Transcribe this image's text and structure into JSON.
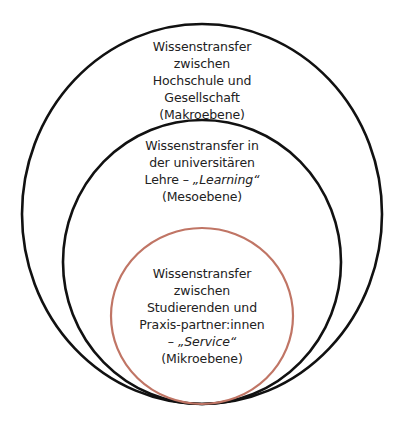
{
  "diagram": {
    "type": "nested-circles",
    "colors": {
      "outer_stroke": "#111111",
      "middle_stroke": "#111111",
      "inner_stroke": "#c07565",
      "text": "#222222",
      "background": "#ffffff"
    },
    "levels": [
      {
        "id": "macro",
        "lines": [
          "Wissenstransfer",
          "zwischen",
          "Hochschule und",
          "Gesellschaft",
          "(Makroebene)"
        ]
      },
      {
        "id": "meso",
        "lines": [
          "Wissenstransfer in",
          "der universitären",
          "Lehre – ",
          "„Learning“",
          "(Mesoebene)"
        ]
      },
      {
        "id": "micro",
        "lines": [
          "Wissenstransfer",
          "zwischen",
          "Studierenden und",
          "Praxis-partner:innen",
          "– ",
          "„Service“",
          "(Mikroebene)"
        ]
      }
    ]
  }
}
